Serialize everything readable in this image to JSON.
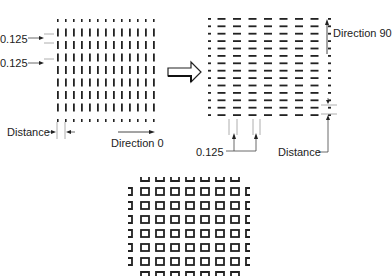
{
  "diagram": {
    "left_panel": {
      "labels": {
        "spacing_top": "0.125",
        "spacing_bottom": "0.125",
        "distance": "Distance",
        "direction": "Direction 0"
      },
      "pattern": {
        "type": "vertical-dashes",
        "columns": 13,
        "full_rows": 7,
        "partial_rows": 2
      }
    },
    "right_panel": {
      "labels": {
        "direction": "Direction 90",
        "spacing": "0.125",
        "distance": "Distance"
      },
      "pattern": {
        "type": "horizontal-dashes",
        "rows": 14,
        "full_columns": 7,
        "partial_columns": 2
      }
    },
    "bottom_panel": {
      "pattern": {
        "type": "hollow-squares",
        "full_columns": 7,
        "full_rows": 6,
        "partial_edges": true
      }
    },
    "transition_arrow": "hollow-right-arrow",
    "colors": {
      "ink": "#222222",
      "guide": "#888888",
      "background": "#ffffff"
    }
  }
}
